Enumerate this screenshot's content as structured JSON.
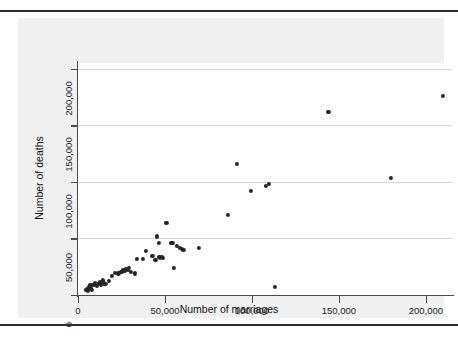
{
  "figure": {
    "background_color": "#f0f0f0",
    "plot_background_color": "#ffffff",
    "gridline_color": "#d7d7d7",
    "marker_color": "#262626",
    "axis_color": "#4a4a4a"
  },
  "chart_data": {
    "type": "scatter",
    "title": "",
    "xlabel": "Number of marriages",
    "ylabel": "Number of deaths",
    "xlim": [
      0,
      215000
    ],
    "ylim": [
      0,
      205000
    ],
    "xticks": [
      0,
      50000,
      100000,
      150000,
      200000
    ],
    "yticks": [
      0,
      50000,
      100000,
      150000,
      200000
    ],
    "xticklabels": [
      "0",
      "50,000",
      "100,000",
      "150,000",
      "200,000"
    ],
    "yticklabels": [
      "0",
      "50,000",
      "100,000",
      "150,000",
      "200,000"
    ],
    "grid": "horizontal",
    "legend": "none",
    "marker": "filled-circle",
    "points": [
      {
        "x": 4500,
        "y": 4300
      },
      {
        "x": 5300,
        "y": 5200
      },
      {
        "x": 5800,
        "y": 3400
      },
      {
        "x": 6200,
        "y": 6900
      },
      {
        "x": 6700,
        "y": 5200
      },
      {
        "x": 7100,
        "y": 8600
      },
      {
        "x": 7600,
        "y": 6000
      },
      {
        "x": 8000,
        "y": 4300
      },
      {
        "x": 8900,
        "y": 8600
      },
      {
        "x": 9800,
        "y": 10300
      },
      {
        "x": 10700,
        "y": 7800
      },
      {
        "x": 11600,
        "y": 9500
      },
      {
        "x": 12500,
        "y": 11200
      },
      {
        "x": 13400,
        "y": 8600
      },
      {
        "x": 14200,
        "y": 12900
      },
      {
        "x": 15100,
        "y": 10300
      },
      {
        "x": 16000,
        "y": 9500
      },
      {
        "x": 17800,
        "y": 12100
      },
      {
        "x": 19600,
        "y": 17200
      },
      {
        "x": 21400,
        "y": 19800
      },
      {
        "x": 23200,
        "y": 19000
      },
      {
        "x": 24900,
        "y": 20700
      },
      {
        "x": 25800,
        "y": 22400
      },
      {
        "x": 26700,
        "y": 21600
      },
      {
        "x": 27600,
        "y": 23300
      },
      {
        "x": 28500,
        "y": 22400
      },
      {
        "x": 29300,
        "y": 24100
      },
      {
        "x": 30200,
        "y": 20700
      },
      {
        "x": 32900,
        "y": 19000
      },
      {
        "x": 33800,
        "y": 31900
      },
      {
        "x": 37400,
        "y": 31900
      },
      {
        "x": 39200,
        "y": 38800
      },
      {
        "x": 42800,
        "y": 34500
      },
      {
        "x": 44500,
        "y": 31000
      },
      {
        "x": 45400,
        "y": 51700
      },
      {
        "x": 46300,
        "y": 45700
      },
      {
        "x": 46800,
        "y": 33600
      },
      {
        "x": 47200,
        "y": 32800
      },
      {
        "x": 48100,
        "y": 33600
      },
      {
        "x": 49000,
        "y": 32800
      },
      {
        "x": 50800,
        "y": 63800
      },
      {
        "x": 53400,
        "y": 45700
      },
      {
        "x": 54300,
        "y": 45700
      },
      {
        "x": 55200,
        "y": 24100
      },
      {
        "x": 57000,
        "y": 43100
      },
      {
        "x": 58800,
        "y": 41400
      },
      {
        "x": 59700,
        "y": 40500
      },
      {
        "x": 60600,
        "y": 39700
      },
      {
        "x": 69500,
        "y": 41400
      },
      {
        "x": 86000,
        "y": 70700
      },
      {
        "x": 91400,
        "y": 115500
      },
      {
        "x": 99500,
        "y": 92200
      },
      {
        "x": 108000,
        "y": 96500
      },
      {
        "x": 109800,
        "y": 98200
      },
      {
        "x": 113400,
        "y": 6900
      },
      {
        "x": 144000,
        "y": 162100
      },
      {
        "x": 180000,
        "y": 103400
      },
      {
        "x": 210000,
        "y": 175600
      }
    ]
  }
}
